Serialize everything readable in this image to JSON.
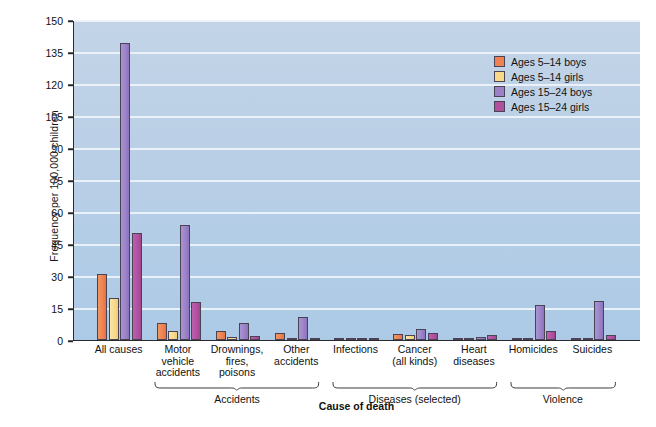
{
  "chart_data": {
    "type": "bar",
    "title": "",
    "xlabel": "Cause of death",
    "ylabel": "Frequency per 100,000 children",
    "ylim": [
      0,
      150
    ],
    "yticks": [
      0,
      15,
      30,
      45,
      60,
      75,
      90,
      105,
      120,
      135,
      150
    ],
    "grid": true,
    "legend_position": "top-right",
    "categories": [
      "All causes",
      "Motor vehicle accidents",
      "Drownings, fires, poisons",
      "Other accidents",
      "Infections",
      "Cancer (all kinds)",
      "Heart diseases",
      "Homicides",
      "Suicides"
    ],
    "category_lines": [
      [
        "All causes"
      ],
      [
        "Motor",
        "vehicle",
        "accidents"
      ],
      [
        "Drownings,",
        "fires,",
        "poisons"
      ],
      [
        "Other",
        "accidents"
      ],
      [
        "Infections"
      ],
      [
        "Cancer",
        "(all kinds)"
      ],
      [
        "Heart",
        "diseases"
      ],
      [
        "Homicides"
      ],
      [
        "Suicides"
      ]
    ],
    "series": [
      {
        "name": "Ages 5–14 boys",
        "color": "#ef8253",
        "values": [
          31,
          8,
          4,
          3.5,
          0.6,
          3,
          0.7,
          0.6,
          0.4
        ]
      },
      {
        "name": "Ages 5–14 girls",
        "color": "#f8d98a",
        "values": [
          19.5,
          4,
          1.5,
          1,
          0.5,
          2.5,
          0.6,
          0.4,
          0.2
        ]
      },
      {
        "name": "Ages 15–24 boys",
        "color": "#9b82c8",
        "values": [
          139,
          54,
          8,
          11,
          0.8,
          5,
          1.6,
          16.5,
          18.5
        ]
      },
      {
        "name": "Ages 15–24 girls",
        "color": "#b0519f",
        "values": [
          50,
          18,
          2,
          0.5,
          0.6,
          3.5,
          2.5,
          4,
          2.5
        ]
      }
    ],
    "group_brackets": [
      {
        "label": "Accidents",
        "start_category": 1,
        "end_category": 3
      },
      {
        "label": "Diseases (selected)",
        "start_category": 4,
        "end_category": 6
      },
      {
        "label": "Violence",
        "start_category": 7,
        "end_category": 8
      }
    ]
  },
  "legend": {
    "items": [
      {
        "label": "Ages 5–14 boys",
        "swatch": "#ef8253"
      },
      {
        "label": "Ages 5–14 girls",
        "swatch": "#f8d98a"
      },
      {
        "label": "Ages 15–24 boys",
        "swatch": "#9b82c8"
      },
      {
        "label": "Ages 15–24 girls",
        "swatch": "#b0519f"
      }
    ]
  },
  "colors": {
    "plot_background": "#b9cfe6",
    "gridline": "#eef4fa",
    "axis": "#2b2b2b",
    "page_background": "#ffffff"
  }
}
